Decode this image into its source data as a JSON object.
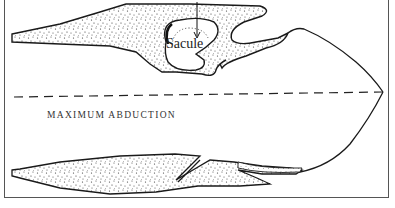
{
  "figure": {
    "labels": {
      "sacule": "Sacule",
      "position": "MAXIMUM ABDUCTION"
    },
    "elements": [
      "upper-vocal-fold-stippled",
      "saccule-cavity",
      "arrow-down",
      "midline-dashed",
      "lower-vocal-fold-stippled",
      "outline-curve"
    ],
    "colors": {
      "stroke": "#1a1a1a",
      "border": "#555555",
      "stipple": "#333333",
      "background": "#ffffff"
    }
  }
}
